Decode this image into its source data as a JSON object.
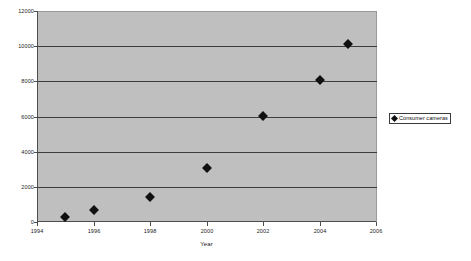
{
  "chart_data": {
    "type": "scatter",
    "title": "",
    "xlabel": "Year",
    "ylabel": "",
    "xlim": [
      1994,
      2006
    ],
    "ylim": [
      0,
      12000
    ],
    "grid": true,
    "legend_position": "right",
    "x_ticks": [
      "1994",
      "1996",
      "1998",
      "2000",
      "2002",
      "2004",
      "2006"
    ],
    "y_ticks": [
      "0",
      "2000",
      "4000",
      "6000",
      "8000",
      "10000",
      "12000"
    ],
    "series": [
      {
        "name": "Consumer cameras",
        "marker": "diamond",
        "color": "#101010",
        "x": [
          1995,
          1996,
          1998,
          2000,
          2002,
          2004,
          2005
        ],
        "values": [
          300,
          700,
          1400,
          3050,
          6050,
          8100,
          10100
        ]
      }
    ]
  },
  "legend": {
    "entries": [
      {
        "label": "Consumer cameras",
        "marker": "diamond-marker"
      }
    ]
  },
  "axes": {
    "x_title": "Year"
  },
  "colors": {
    "plot_background": "#bfbfbf",
    "page_background": "#ffffff",
    "gridline": "#3c3c3c",
    "axis": "#4d4d4d",
    "marker": "#101010"
  }
}
